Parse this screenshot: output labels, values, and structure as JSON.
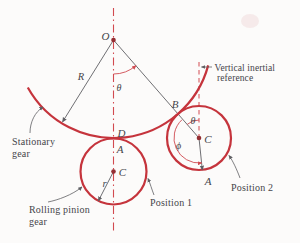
{
  "figure": {
    "type": "rolling-pinion-gear-kinematics-diagram",
    "background": "#fcfbfa",
    "colors": {
      "gear_red": "#c5343c",
      "center_line_red": "#d24a50",
      "line_gray": "#5f5f63",
      "text": "#45454a",
      "point_dot": "#942e32"
    },
    "points": {
      "pivot": "O",
      "contact_pos2": "B",
      "center_pos1": "C",
      "center_pos2": "C",
      "contact_stationary": "D",
      "contact_pos1": "A",
      "rotated_point_pos2": "A"
    },
    "dimensions": {
      "outer_radius": "R",
      "pinion_radius": "r",
      "theta_main": "θ",
      "theta_pos2": "θ",
      "phi": "ϕ"
    },
    "labels": {
      "stationary_gear_line1": "Stationary",
      "stationary_gear_line2": "gear",
      "rolling_pinion_line1": "Rolling pinion",
      "rolling_pinion_line2": "gear",
      "position1": "Position 1",
      "position2": "Position 2",
      "vertical_ref_line1": "Vertical inertial",
      "vertical_ref_line2": "reference"
    }
  }
}
